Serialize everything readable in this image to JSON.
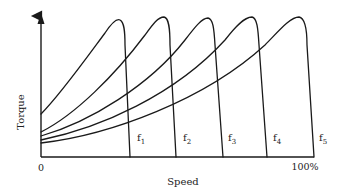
{
  "diagram": {
    "title": "",
    "y_axis_label": "Torque",
    "x_axis_label": "Speed",
    "x_tick_start": "0",
    "x_tick_end": "100%",
    "curves": [
      {
        "label": "f",
        "sub": "1"
      },
      {
        "label": "f",
        "sub": "2"
      },
      {
        "label": "f",
        "sub": "3"
      },
      {
        "label": "f",
        "sub": "4"
      },
      {
        "label": "f",
        "sub": "5"
      }
    ],
    "line_color": "#1a1a1a"
  }
}
